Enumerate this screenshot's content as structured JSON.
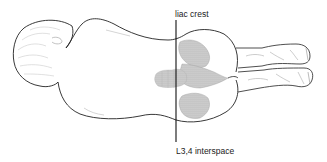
{
  "figure": {
    "labels": {
      "top": "liac crest",
      "bottom": "L3,4 interspace"
    },
    "reference_line": {
      "orientation": "vertical",
      "x": 176,
      "y_start": 20,
      "y_end": 142,
      "color": "#111111"
    },
    "colors": {
      "outline": "#222222",
      "shading": "#c8c8c8",
      "hair": "#bbbbbb",
      "background": "#ffffff"
    },
    "regions": [
      "head",
      "torso",
      "spine",
      "pelvis",
      "buttocks",
      "legs",
      "feet"
    ]
  }
}
